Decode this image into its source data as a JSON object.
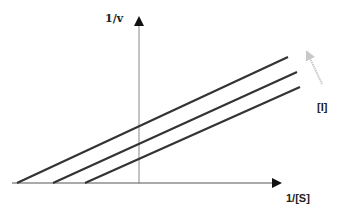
{
  "diagram": {
    "type": "Lineweaver-Burk plot (competitive inhibition)",
    "y_axis_label": "1/v",
    "x_axis_label": "1/[S]",
    "inhibitor_label": "[I]",
    "colors": {
      "axis": "#333333",
      "y_axis": "#888888",
      "lines": "#333333",
      "inhibitor_arrow": "#c8c8c8"
    },
    "lines": [
      {
        "name": "highest-inhibitor",
        "x1": 17,
        "y1": 183,
        "x2": 288,
        "y2": 57
      },
      {
        "name": "medium-inhibitor",
        "x1": 53,
        "y1": 183,
        "x2": 297,
        "y2": 72
      },
      {
        "name": "lowest-inhibitor",
        "x1": 85,
        "y1": 183,
        "x2": 300,
        "y2": 87
      }
    ]
  }
}
